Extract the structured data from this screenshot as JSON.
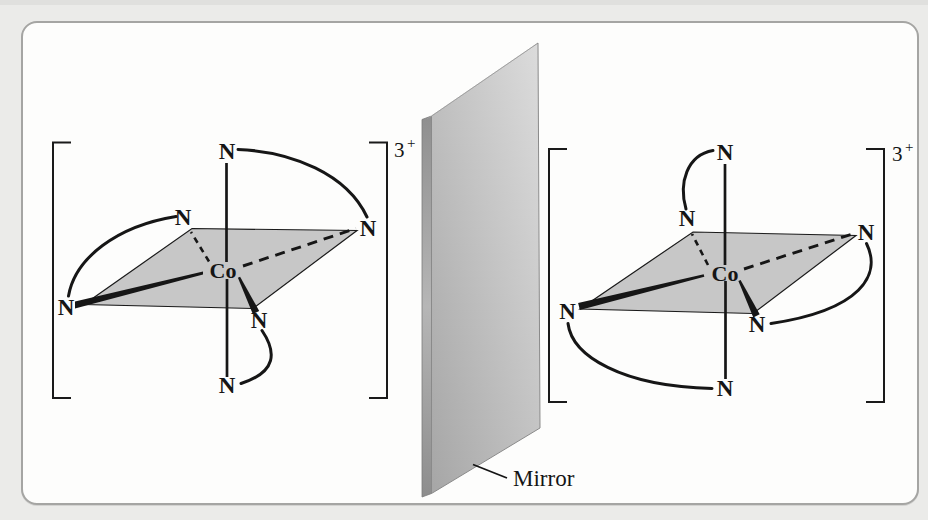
{
  "frame": {
    "background": "#ebebe9",
    "card_fill": "#fdfdfc",
    "card_border": "#a5a5a3"
  },
  "left_complex": {
    "charge_number": "3",
    "charge_sign": "+",
    "metal_label": "Co",
    "nitrogens": {
      "top": "N",
      "back_left": "N",
      "back_right": "N",
      "front_left": "N",
      "front_right": "N",
      "bottom": "N"
    }
  },
  "right_complex": {
    "charge_number": "3",
    "charge_sign": "+",
    "metal_label": "Co",
    "nitrogens": {
      "top": "N",
      "back_left": "N",
      "back_right": "N",
      "front_left": "N",
      "front_right": "N",
      "bottom": "N"
    }
  },
  "mirror": {
    "label": "Mirror"
  },
  "colors": {
    "plane_fill": "#c7c7c7",
    "bond": "#161616",
    "mirror_face_light": "#dcdcdc",
    "mirror_face_mid": "#c4c4c4",
    "mirror_face_dark": "#a6a6a6",
    "mirror_edge": "#9c9c9c"
  }
}
